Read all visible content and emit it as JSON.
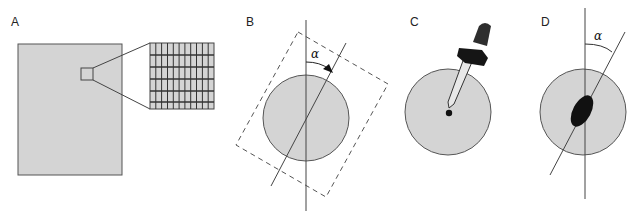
{
  "figure": {
    "colors": {
      "fill_gray": "#d4d4d4",
      "stroke": "#444444",
      "dark": "#111111"
    },
    "panels": [
      {
        "id": "A",
        "label": "A",
        "description": "Large gray rectangle with a small square region magnified into a grid"
      },
      {
        "id": "B",
        "label": "B",
        "description": "Gray circle with vertical axis, tilted dashed rectangle and tilted line; rotation angle indicated by arrow",
        "angle_symbol": "α"
      },
      {
        "id": "C",
        "label": "C",
        "description": "Gray circle with a dropper depositing a drop at the center"
      },
      {
        "id": "D",
        "label": "D",
        "description": "Gray circle with vertical axis, tilted line and black ellipse aligned with the tilted line",
        "angle_symbol": "α"
      }
    ]
  }
}
